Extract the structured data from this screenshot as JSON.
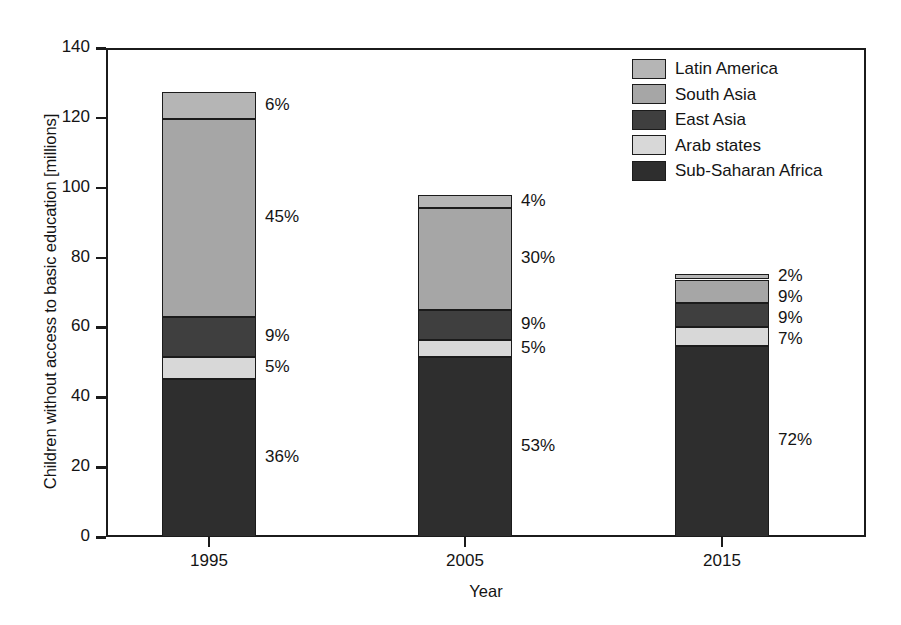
{
  "chart_data": {
    "type": "bar",
    "subtype": "stacked-bar",
    "title": "",
    "xlabel": "Year",
    "ylabel": "Children without access to basic education [millions]",
    "categories": [
      "1995",
      "2005",
      "2015"
    ],
    "ylim": [
      0,
      140
    ],
    "yticks": [
      0,
      20,
      40,
      60,
      80,
      100,
      120,
      140
    ],
    "ytick_labels": [
      "0",
      "20",
      "40",
      "60",
      "80",
      "100",
      "120",
      "140"
    ],
    "grid": false,
    "legend_position": "top-right",
    "stack_order_bottom_to_top": [
      "Sub-Saharan Africa",
      "Arab states",
      "East Asia",
      "South Asia",
      "Latin America"
    ],
    "totals_millions": [
      126,
      97,
      76
    ],
    "series": [
      {
        "name": "Sub-Saharan Africa",
        "color": "#2e2e2e",
        "percent": [
          36,
          53,
          72
        ],
        "percent_labels": [
          "36%",
          "53%",
          "72%"
        ],
        "values_millions": [
          45.4,
          51.4,
          54.7
        ]
      },
      {
        "name": "Arab states",
        "color": "#d8d8d8",
        "percent": [
          5,
          5,
          7
        ],
        "percent_labels": [
          "5%",
          "5%",
          "7%"
        ],
        "values_millions": [
          6.3,
          4.9,
          5.3
        ]
      },
      {
        "name": "East Asia",
        "color": "#3f3f3f",
        "percent": [
          9,
          9,
          9
        ],
        "percent_labels": [
          "9%",
          "9%",
          "9%"
        ],
        "values_millions": [
          11.3,
          8.7,
          6.8
        ]
      },
      {
        "name": "South Asia",
        "color": "#a6a6a6",
        "percent": [
          45,
          30,
          9
        ],
        "percent_labels": [
          "45%",
          "30%",
          "9%"
        ],
        "values_millions": [
          56.7,
          29.1,
          6.8
        ]
      },
      {
        "name": "Latin America",
        "color": "#b5b5b5",
        "percent": [
          6,
          4,
          2
        ],
        "percent_labels": [
          "6%",
          "4%",
          "2%"
        ],
        "values_millions": [
          7.6,
          3.9,
          1.5
        ]
      }
    ]
  },
  "legend": {
    "entries": [
      {
        "label": "Latin America",
        "color": "#b5b5b5"
      },
      {
        "label": "South Asia",
        "color": "#a6a6a6"
      },
      {
        "label": "East Asia",
        "color": "#3f3f3f"
      },
      {
        "label": "Arab states",
        "color": "#d8d8d8"
      },
      {
        "label": "Sub-Saharan Africa",
        "color": "#2e2e2e"
      }
    ]
  },
  "axes": {
    "y_title": "Children without access to basic education [millions]",
    "x_title": "Year",
    "y_tick_labels": [
      "0",
      "20",
      "40",
      "60",
      "80",
      "100",
      "120",
      "140"
    ],
    "x_tick_labels": [
      "1995",
      "2005",
      "2015"
    ]
  },
  "colors": {
    "axis": "#1b1b1b",
    "background": "#ffffff",
    "text": "#141414"
  }
}
